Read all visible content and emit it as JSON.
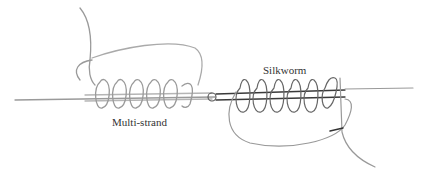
{
  "diagram": {
    "type": "knot-illustration",
    "labels": {
      "multi_strand": "Multi-strand",
      "silkworm": "Silkworm"
    },
    "colors": {
      "line": "#aaaaaa",
      "dark_line": "#444444",
      "background": "#ffffff",
      "text": "#333333"
    }
  }
}
